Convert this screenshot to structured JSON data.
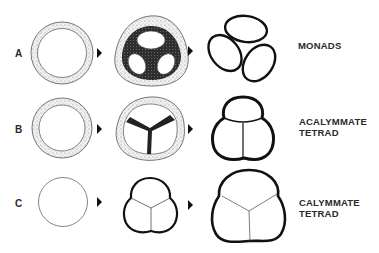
{
  "diagram": {
    "rows": [
      {
        "key": "A",
        "label": "A",
        "result_line1": "MONADS",
        "result_line2": ""
      },
      {
        "key": "B",
        "label": "B",
        "result_line1": "ACALYMMATE",
        "result_line2": "TETRAD"
      },
      {
        "key": "C",
        "label": "C",
        "result_line1": "CALYMMATE",
        "result_line2": "TETRAD"
      }
    ],
    "arrow_icon": "right-arrowhead",
    "colors": {
      "ink": "#111111",
      "stipple": "#d8d8d8",
      "dense": "#2a2a2a"
    }
  }
}
